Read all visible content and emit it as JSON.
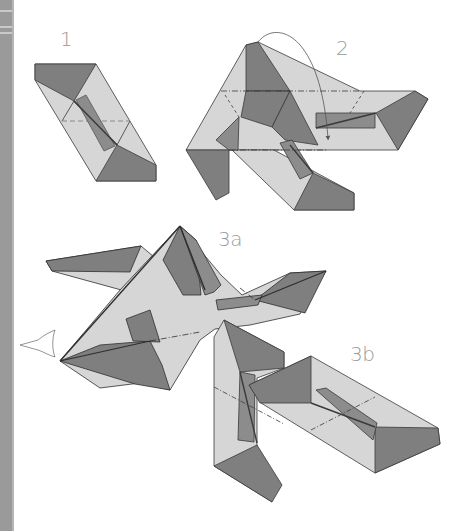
{
  "steps": {
    "s1": {
      "label": "1"
    },
    "s2": {
      "label": "2"
    },
    "s3a": {
      "label": "3a"
    },
    "s3b": {
      "label": "3b"
    }
  },
  "colors": {
    "light_face": "#d6d6d6",
    "dark_face": "#7f7f7f",
    "mid_face": "#8c8c8c",
    "stroke": "#3a3a3a",
    "label": "#9a9a9a",
    "side_stripe": "#9a9a9a"
  },
  "icons": {
    "rotate_arrow": "curved-arrow",
    "view_arrow": "hollow-arrow-right"
  }
}
